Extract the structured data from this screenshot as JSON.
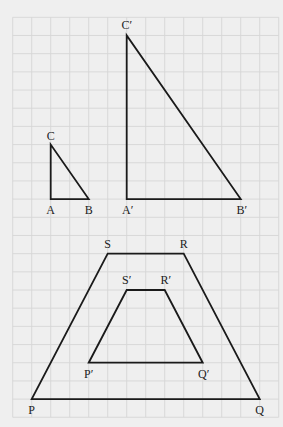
{
  "grid": {
    "origin_x": 12.7,
    "origin_y": 17.3,
    "cell_w": 19,
    "cell_h": 18.18,
    "cols": 14,
    "rows": 22,
    "background": "#efefef",
    "line_color": "#d6d6d6"
  },
  "figures": [
    {
      "name": "triangle-ABC",
      "type": "triangle",
      "vertices": [
        {
          "label": "A",
          "col": 2,
          "row": 10,
          "lx": 0,
          "ly": 15
        },
        {
          "label": "B",
          "col": 4,
          "row": 10,
          "lx": 0,
          "ly": 15
        },
        {
          "label": "C",
          "col": 2,
          "row": 7,
          "lx": 0,
          "ly": -5
        }
      ]
    },
    {
      "name": "triangle-A'B'C'",
      "type": "triangle",
      "vertices": [
        {
          "label": "A′",
          "col": 6,
          "row": 10,
          "lx": 1,
          "ly": 15
        },
        {
          "label": "B′",
          "col": 12,
          "row": 10,
          "lx": 1,
          "ly": 15
        },
        {
          "label": "C′",
          "col": 6,
          "row": 1,
          "lx": 0,
          "ly": -6
        }
      ]
    },
    {
      "name": "trapezoid-PQRS",
      "type": "quadrilateral",
      "vertices": [
        {
          "label": "P",
          "col": 1,
          "row": 21,
          "lx": 0,
          "ly": 15
        },
        {
          "label": "Q",
          "col": 13,
          "row": 21,
          "lx": 0,
          "ly": 15
        },
        {
          "label": "R",
          "col": 9,
          "row": 13,
          "lx": 0,
          "ly": -6
        },
        {
          "label": "S",
          "col": 5,
          "row": 13,
          "lx": 0,
          "ly": -6
        }
      ]
    },
    {
      "name": "trapezoid-P'Q'R'S'",
      "type": "quadrilateral",
      "vertices": [
        {
          "label": "P′",
          "col": 4,
          "row": 19,
          "lx": 0,
          "ly": 15
        },
        {
          "label": "Q′",
          "col": 10,
          "row": 19,
          "lx": 1,
          "ly": 15
        },
        {
          "label": "R′",
          "col": 8,
          "row": 15,
          "lx": 1,
          "ly": -6
        },
        {
          "label": "S′",
          "col": 6,
          "row": 15,
          "lx": 0,
          "ly": -6
        }
      ]
    }
  ],
  "labels": {
    "A": "A",
    "B": "B",
    "C": "C",
    "A_prime": "A′",
    "B_prime": "B′",
    "C_prime": "C′",
    "P": "P",
    "Q": "Q",
    "R": "R",
    "S": "S",
    "P_prime": "P′",
    "Q_prime": "Q′",
    "R_prime": "R′",
    "S_prime": "S′"
  }
}
